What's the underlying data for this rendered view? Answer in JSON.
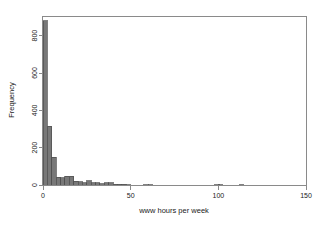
{
  "figure": {
    "background_color": "#ffffff",
    "frame_color": "#8a8a8a",
    "text_color": "#1a1a1a"
  },
  "chart_data": {
    "type": "bar",
    "title": "",
    "xlabel": "www hours per week",
    "ylabel": "Frequency",
    "xlim": [
      0,
      150
    ],
    "ylim": [
      0,
      900
    ],
    "xticks": [
      0,
      50,
      100,
      150
    ],
    "xtick_labels": [
      "0",
      "50",
      "100",
      "150"
    ],
    "yticks": [
      0,
      200,
      400,
      600,
      800
    ],
    "ytick_labels": [
      "0",
      "200",
      "400",
      "600",
      "800"
    ],
    "grid": false,
    "legend": false,
    "bar_fill_color": "#787878",
    "bar_edge_color": "#4d4d4d",
    "bin_width": 2.5,
    "bin_starts": [
      0,
      2.5,
      5,
      7.5,
      10,
      12.5,
      15,
      17.5,
      20,
      22.5,
      25,
      27.5,
      30,
      32.5,
      35,
      37.5,
      40,
      42.5,
      45,
      47.5,
      50,
      57.5,
      60,
      98,
      100,
      112
    ],
    "values": [
      880,
      315,
      150,
      42,
      40,
      48,
      47,
      20,
      17,
      13,
      22,
      13,
      12,
      7,
      12,
      11,
      5,
      4,
      3,
      2,
      0,
      2,
      2,
      2,
      2,
      2
    ],
    "categories": [
      "0-2.5",
      "2.5-5",
      "5-7.5",
      "7.5-10",
      "10-12.5",
      "12.5-15",
      "15-17.5",
      "17.5-20",
      "20-22.5",
      "22.5-25",
      "25-27.5",
      "27.5-30",
      "30-32.5",
      "32.5-35",
      "35-37.5",
      "37.5-40",
      "40-42.5",
      "42.5-45",
      "45-47.5",
      "47.5-50",
      "50-52.5",
      "57.5-60",
      "60-62.5",
      "98-100.5",
      "100-102.5",
      "112-114.5"
    ]
  }
}
